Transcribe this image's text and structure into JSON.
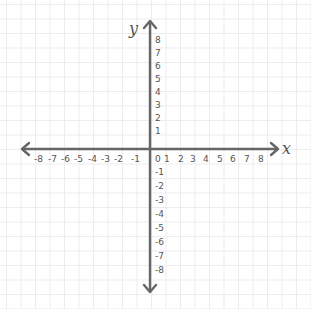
{
  "diagram": {
    "type": "cartesian-coordinate-plane",
    "axis_labels": {
      "x": "x",
      "y": "y"
    },
    "x_axis": {
      "negative_ticks": [
        "-8",
        "-7",
        "-6",
        "-5",
        "-4",
        "-3",
        "-2",
        "-1"
      ],
      "origin": "0",
      "positive_ticks": [
        "1",
        "2",
        "3",
        "4",
        "5",
        "6",
        "7",
        "8"
      ]
    },
    "y_axis": {
      "positive_ticks": [
        "8",
        "7",
        "6",
        "5",
        "4",
        "3",
        "2",
        "1"
      ],
      "negative_ticks": [
        "-1",
        "-2",
        "-3",
        "-4",
        "-5",
        "-6",
        "-7",
        "-8"
      ]
    },
    "colors": {
      "axis": "#666666",
      "labels": "#555555",
      "grid": "#ececec",
      "background": "#ffffff"
    }
  }
}
